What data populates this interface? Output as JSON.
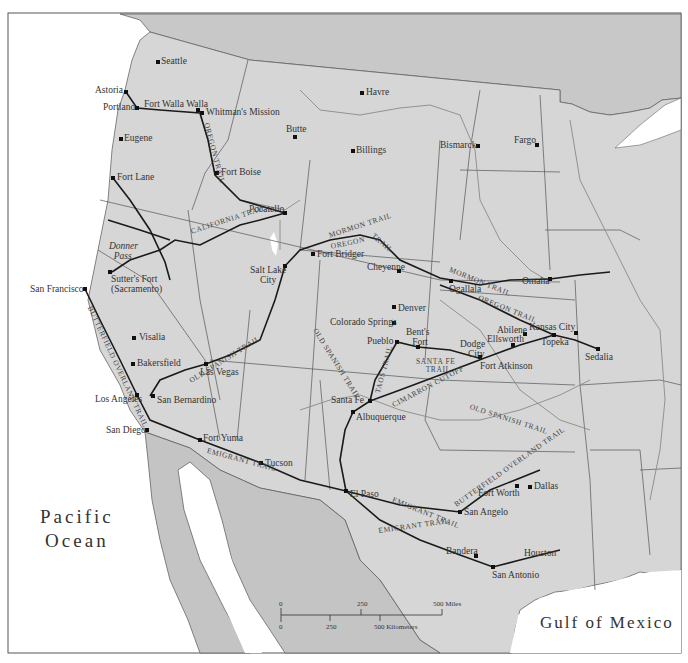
{
  "map": {
    "title": "Western Trails Map",
    "colors": {
      "land": "#d6d6d6",
      "foreign_land": "#c4c4c4",
      "water": "#ffffff",
      "trail": "#1a1a1a",
      "river": "#8a8a8a",
      "border": "#555555"
    },
    "water_bodies": {
      "pacific": "Pacific Ocean",
      "pacific_line1": "Pacific",
      "pacific_line2": "Ocean",
      "gulf": "Gulf of Mexico"
    },
    "cities": [
      {
        "name": "Seattle",
        "x": 158,
        "y": 62
      },
      {
        "name": "Astoria",
        "x": 126,
        "y": 92
      },
      {
        "name": "Portland",
        "x": 137,
        "y": 108
      },
      {
        "name": "Fort Walla Walla",
        "x": 198,
        "y": 110
      },
      {
        "name": "Whitman's Mission",
        "x": 202,
        "y": 113
      },
      {
        "name": "Eugene",
        "x": 121,
        "y": 139
      },
      {
        "name": "Butte",
        "x": 295,
        "y": 137
      },
      {
        "name": "Havre",
        "x": 362,
        "y": 93
      },
      {
        "name": "Billings",
        "x": 353,
        "y": 151
      },
      {
        "name": "Bismarck",
        "x": 478,
        "y": 146
      },
      {
        "name": "Fargo",
        "x": 537,
        "y": 145
      },
      {
        "name": "Fort Boise",
        "x": 217,
        "y": 173
      },
      {
        "name": "Fort Lane",
        "x": 113,
        "y": 178
      },
      {
        "name": "Pocatello",
        "x": 285,
        "y": 213
      },
      {
        "name": "Salt Lake City",
        "x": 285,
        "y": 266
      },
      {
        "name": "Fort Bridger",
        "x": 313,
        "y": 254
      },
      {
        "name": "Cheyenne",
        "x": 399,
        "y": 271
      },
      {
        "name": "Ogallala",
        "x": 451,
        "y": 281
      },
      {
        "name": "Omaha",
        "x": 550,
        "y": 279
      },
      {
        "name": "Sutter's Fort (Sacramento)",
        "x": 110,
        "y": 272
      },
      {
        "name": "San Francisco",
        "x": 85,
        "y": 289
      },
      {
        "name": "Denver",
        "x": 394,
        "y": 307
      },
      {
        "name": "Colorado Springs",
        "x": 394,
        "y": 323
      },
      {
        "name": "Pueblo",
        "x": 397,
        "y": 342
      },
      {
        "name": "Bent's Fort",
        "x": 418,
        "y": 347
      },
      {
        "name": "Dodge City",
        "x": 480,
        "y": 357
      },
      {
        "name": "Fort Atkinson",
        "x": 482,
        "y": 359
      },
      {
        "name": "Abilene",
        "x": 525,
        "y": 334
      },
      {
        "name": "Ellsworth",
        "x": 513,
        "y": 345
      },
      {
        "name": "Kansas City",
        "x": 554,
        "y": 335
      },
      {
        "name": "Topeka",
        "x": 554,
        "y": 339
      },
      {
        "name": "Sedalia",
        "x": 598,
        "y": 349
      },
      {
        "name": "Visalia",
        "x": 134,
        "y": 338
      },
      {
        "name": "Bakersfield",
        "x": 133,
        "y": 364
      },
      {
        "name": "Las Vegas",
        "x": 206,
        "y": 364
      },
      {
        "name": "Santa Fe",
        "x": 370,
        "y": 401
      },
      {
        "name": "Albuquerque",
        "x": 353,
        "y": 412
      },
      {
        "name": "Los Angeles",
        "x": 137,
        "y": 395
      },
      {
        "name": "San Bernardino",
        "x": 153,
        "y": 396
      },
      {
        "name": "San Diego",
        "x": 147,
        "y": 430
      },
      {
        "name": "Fort Yuma",
        "x": 200,
        "y": 440
      },
      {
        "name": "Tucson",
        "x": 261,
        "y": 463
      },
      {
        "name": "El Paso",
        "x": 346,
        "y": 491
      },
      {
        "name": "Fort Worth",
        "x": 517,
        "y": 486
      },
      {
        "name": "Dallas",
        "x": 530,
        "y": 487
      },
      {
        "name": "San Angelo",
        "x": 460,
        "y": 512
      },
      {
        "name": "Bandera",
        "x": 476,
        "y": 556
      },
      {
        "name": "Houston",
        "x": 555,
        "y": 556
      },
      {
        "name": "San Antonio",
        "x": 493,
        "y": 567
      },
      {
        "name": "Donner Pass",
        "x": 122,
        "y": 262
      }
    ],
    "trails": [
      "Oregon Trail",
      "California Trail",
      "Mormon Trail",
      "Old Spanish Trail",
      "Butterfield Overland Trail",
      "Emigrant Trail",
      "Santa Fe Trail",
      "Cimarron Cutoff",
      "Taos Trail"
    ],
    "scale_bar": {
      "miles_ticks": [
        "0",
        "250",
        "500 Miles"
      ],
      "km_ticks": [
        "0",
        "250",
        "500 Kilometers"
      ]
    }
  },
  "labels": {
    "seattle": "Seattle",
    "astoria": "Astoria",
    "portland": "Portland",
    "fort_walla_walla": "Fort Walla Walla",
    "whitmans_mission": "Whitman's Mission",
    "eugene": "Eugene",
    "butte": "Butte",
    "havre": "Havre",
    "billings": "Billings",
    "bismarck": "Bismarck",
    "fargo": "Fargo",
    "fort_boise": "Fort Boise",
    "fort_lane": "Fort Lane",
    "pocatello": "Pocatello",
    "salt_lake_city_1": "Salt Lake",
    "salt_lake_city_2": "City",
    "fort_bridger": "Fort Bridger",
    "cheyenne": "Cheyenne",
    "ogallala": "Ogallala",
    "omaha": "Omaha",
    "donner_1": "Donner",
    "donner_2": "Pass",
    "sutters_1": "Sutter's Fort",
    "sutters_2": "(Sacramento)",
    "san_francisco": "San Francisco",
    "denver": "Denver",
    "colorado_springs": "Colorado Springs",
    "pueblo": "Pueblo",
    "bents_1": "Bent's",
    "bents_2": "Fort",
    "dodge_1": "Dodge",
    "dodge_2": "City",
    "fort_atkinson": "Fort Atkinson",
    "abilene": "Abilene",
    "ellsworth": "Ellsworth",
    "kansas_city": "Kansas City",
    "topeka": "Topeka",
    "sedalia": "Sedalia",
    "visalia": "Visalia",
    "bakersfield": "Bakersfield",
    "las_vegas": "Las Vegas",
    "santa_fe": "Santa Fe",
    "albuquerque": "Albuquerque",
    "los_angeles": "Los Angeles",
    "san_bernardino": "San Bernardino",
    "san_diego": "San Diego",
    "fort_yuma": "Fort Yuma",
    "tucson": "Tucson",
    "el_paso": "El Paso",
    "fort_worth": "Fort Worth",
    "dallas": "Dallas",
    "san_angelo": "San Angelo",
    "bandera": "Bandera",
    "houston": "Houston",
    "san_antonio": "San Antonio"
  },
  "trail_labels": {
    "oregon_nw": "OREGON TRAIL",
    "california": "CALIFORNIA TRAIL",
    "mormon_w": "MORMON TRAIL",
    "oregon_w": "OREGON",
    "trail_w": "TRAIL",
    "mormon_e": "MORMON TRAIL",
    "oregon_e": "OREGON TRAIL",
    "old_spanish_w": "OLD SPANISH TRAIL",
    "old_spanish_c": "OLD SPANISH TRAIL",
    "old_spanish_e": "OLD SPANISH TRAIL",
    "butterfield_w": "BUTTERFIELD OVERLAND TRAIL",
    "butterfield_e": "BUTTERFIELD OVERLAND TRAIL",
    "emigrant_w": "EMIGRANT TRAIL",
    "emigrant_e1": "EMIGRANT TRAIL",
    "emigrant_e2": "EMIGRANT TRAIL",
    "santa_fe_1": "SANTA FE",
    "santa_fe_2": "TRAIL",
    "cimarron": "CIMARRON CUTOFF",
    "taos": "TAOS TRAIL"
  }
}
